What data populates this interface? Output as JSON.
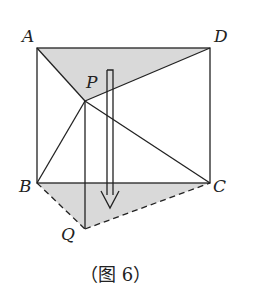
{
  "caption": "（图 6）",
  "labels": {
    "A": "A",
    "D": "D",
    "P": "P",
    "B": "B",
    "C": "C",
    "Q": "Q"
  },
  "colors": {
    "stroke": "#222222",
    "shade": "#d9d9d9"
  }
}
